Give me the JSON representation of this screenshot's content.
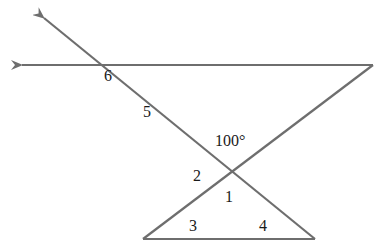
{
  "diagram": {
    "type": "geometry-angles",
    "stroke_color": "#6e6e6e",
    "label_color": "#1a1a1a",
    "angle_labels": [
      {
        "id": "angle-6",
        "text": "6",
        "x": 104,
        "y": 68
      },
      {
        "id": "angle-5",
        "text": "5",
        "x": 143,
        "y": 104
      },
      {
        "id": "angle-given",
        "text": "100°",
        "x": 215,
        "y": 133
      },
      {
        "id": "angle-2",
        "text": "2",
        "x": 193,
        "y": 168
      },
      {
        "id": "angle-1",
        "text": "1",
        "x": 225,
        "y": 189
      },
      {
        "id": "angle-3",
        "text": "3",
        "x": 189,
        "y": 218
      },
      {
        "id": "angle-4",
        "text": "4",
        "x": 259,
        "y": 218
      }
    ],
    "given_angle": "100°"
  }
}
